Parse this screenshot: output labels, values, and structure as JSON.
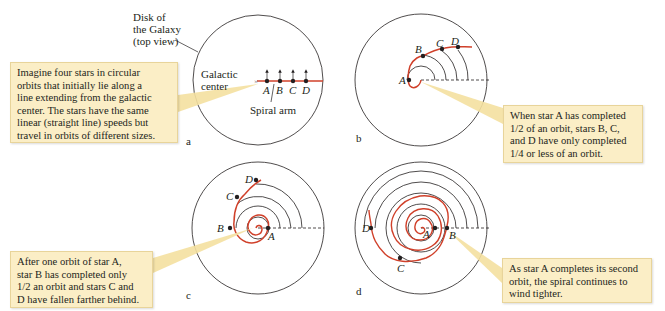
{
  "figure": {
    "panels": [
      {
        "id": "a",
        "label": "a",
        "annotations": {
          "disk": "Disk of the Galaxy (top view)",
          "disk_line1": "Disk of",
          "disk_line2": "the Galaxy",
          "disk_line3": "(top view)",
          "center_line1": "Galactic",
          "center_line2": "center",
          "spiral_arm": "Spiral arm"
        },
        "stars": [
          "A",
          "B",
          "C",
          "D"
        ],
        "callout_lines": [
          "Imagine four stars in circular",
          "orbits that initially lie along a",
          "line extending from the galactic",
          "center. The stars have the same",
          "linear (straight line) speeds but",
          "travel in orbits of different sizes."
        ]
      },
      {
        "id": "b",
        "label": "b",
        "stars": [
          "A",
          "B",
          "C",
          "D"
        ],
        "callout_lines": [
          "When star A has completed",
          "1/2 of an orbit, stars B, C,",
          "and D have only completed",
          "1/4 or less of an orbit."
        ]
      },
      {
        "id": "c",
        "label": "c",
        "stars": [
          "A",
          "B",
          "C",
          "D"
        ],
        "callout_lines": [
          "After one orbit of star A,",
          "star B has completed only",
          "1/2 an orbit and stars C and",
          "D have fallen farther behind."
        ]
      },
      {
        "id": "d",
        "label": "d",
        "stars": [
          "A",
          "B",
          "C",
          "D"
        ],
        "callout_lines": [
          "As star A completes its second",
          "orbit, the spiral continues to",
          "wind tighter."
        ]
      }
    ],
    "colors": {
      "spiral": "#d0402a",
      "callout_bg": "#fbeec6",
      "callout_pointer": "#f4e0a0",
      "line": "#231f20"
    }
  }
}
